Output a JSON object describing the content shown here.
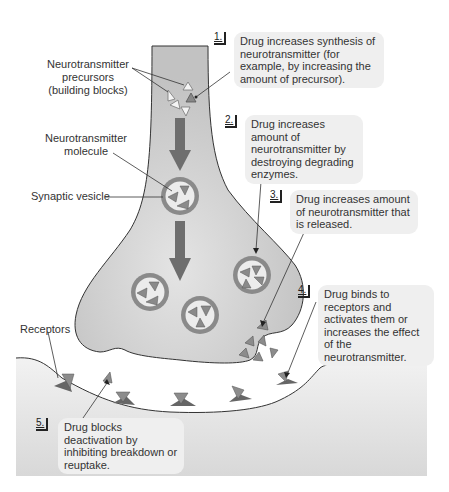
{
  "diagram": {
    "type": "synapse-drug-effects",
    "colors": {
      "presynaptic_fill": "#c8c8c8",
      "postsynaptic_fill": "#e6e6e6",
      "neurotransmitter": "#8c8c8c",
      "receptor": "#6e6e6e",
      "vesicle_ring": "#7a7a7a",
      "vesicle_inner": "#ececec",
      "arrow": "#707070",
      "callout_bg": "#efefef"
    },
    "labels": {
      "precursors": "Neurotransmitter precursors (building blocks)",
      "precursors_line1": "Neurotransmitter",
      "precursors_line2": "precursors",
      "precursors_line3": "(building blocks)",
      "molecule_line1": "Neurotransmitter",
      "molecule_line2": "molecule",
      "vesicle": "Synaptic vesicle",
      "receptors": "Receptors"
    },
    "steps": [
      {
        "number": "1.",
        "text": "Drug increases synthesis of neurotransmitter (for example, by increasing the amount of precursor)."
      },
      {
        "number": "2.",
        "text": "Drug increases amount of neurotransmitter by destroying degrading enzymes."
      },
      {
        "number": "3.",
        "text": "Drug increases amount of neurotransmitter that is released."
      },
      {
        "number": "4.",
        "text": "Drug binds to receptors and activates them or increases the effect of the neurotransmitter."
      },
      {
        "number": "5.",
        "text": "Drug blocks deactivation by inhibiting breakdown or reuptake."
      }
    ]
  }
}
